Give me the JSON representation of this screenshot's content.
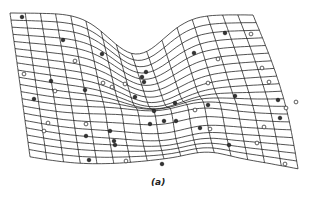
{
  "figure": {
    "caption": "(a)",
    "line_color": "#1a1a1a",
    "point_fill_dark": "#333333",
    "point_fill_light": "#ffffff",
    "grid": {
      "cols": 16,
      "rows": 20,
      "corners": {
        "top_left": [
          10,
          13
        ],
        "top_right": [
          253,
          15
        ],
        "bottom_right": [
          298,
          167
        ],
        "bottom_left": [
          30,
          155
        ]
      }
    },
    "points": [
      {
        "x": 22,
        "y": 17,
        "type": "dark"
      },
      {
        "x": 63,
        "y": 40,
        "type": "dark"
      },
      {
        "x": 102,
        "y": 54,
        "type": "dark"
      },
      {
        "x": 75,
        "y": 61,
        "type": "light"
      },
      {
        "x": 24,
        "y": 74,
        "type": "light"
      },
      {
        "x": 51,
        "y": 81,
        "type": "dark"
      },
      {
        "x": 55,
        "y": 91,
        "type": "light"
      },
      {
        "x": 85,
        "y": 90,
        "type": "dark"
      },
      {
        "x": 34,
        "y": 99,
        "type": "dark"
      },
      {
        "x": 103,
        "y": 83,
        "type": "light"
      },
      {
        "x": 112,
        "y": 87,
        "type": "light"
      },
      {
        "x": 125,
        "y": 84,
        "type": "light"
      },
      {
        "x": 146,
        "y": 72,
        "type": "dark"
      },
      {
        "x": 142,
        "y": 77,
        "type": "dark"
      },
      {
        "x": 144,
        "y": 82,
        "type": "dark"
      },
      {
        "x": 135,
        "y": 97,
        "type": "dark"
      },
      {
        "x": 48,
        "y": 123,
        "type": "light"
      },
      {
        "x": 44,
        "y": 131,
        "type": "light"
      },
      {
        "x": 86,
        "y": 124,
        "type": "light"
      },
      {
        "x": 86,
        "y": 136,
        "type": "dark"
      },
      {
        "x": 110,
        "y": 131,
        "type": "dark"
      },
      {
        "x": 114,
        "y": 141,
        "type": "dark"
      },
      {
        "x": 115,
        "y": 145,
        "type": "dark"
      },
      {
        "x": 89,
        "y": 160,
        "type": "dark"
      },
      {
        "x": 126,
        "y": 161,
        "type": "light"
      },
      {
        "x": 162,
        "y": 164,
        "type": "dark"
      },
      {
        "x": 154,
        "y": 111,
        "type": "dark"
      },
      {
        "x": 150,
        "y": 124,
        "type": "dark"
      },
      {
        "x": 175,
        "y": 103,
        "type": "dark"
      },
      {
        "x": 164,
        "y": 121,
        "type": "dark"
      },
      {
        "x": 208,
        "y": 105,
        "type": "dark"
      },
      {
        "x": 176,
        "y": 121,
        "type": "dark"
      },
      {
        "x": 195,
        "y": 110,
        "type": "light"
      },
      {
        "x": 210,
        "y": 129,
        "type": "light"
      },
      {
        "x": 200,
        "y": 128,
        "type": "dark"
      },
      {
        "x": 225,
        "y": 33,
        "type": "dark"
      },
      {
        "x": 251,
        "y": 34,
        "type": "light"
      },
      {
        "x": 194,
        "y": 53,
        "type": "dark"
      },
      {
        "x": 218,
        "y": 59,
        "type": "light"
      },
      {
        "x": 262,
        "y": 68,
        "type": "light"
      },
      {
        "x": 269,
        "y": 82,
        "type": "light"
      },
      {
        "x": 208,
        "y": 83,
        "type": "light"
      },
      {
        "x": 235,
        "y": 96,
        "type": "dark"
      },
      {
        "x": 278,
        "y": 100,
        "type": "dark"
      },
      {
        "x": 280,
        "y": 118,
        "type": "dark"
      },
      {
        "x": 264,
        "y": 127,
        "type": "light"
      },
      {
        "x": 257,
        "y": 143,
        "type": "light"
      },
      {
        "x": 229,
        "y": 145,
        "type": "dark"
      },
      {
        "x": 285,
        "y": 164,
        "type": "light"
      },
      {
        "x": 286,
        "y": 108,
        "type": "light"
      },
      {
        "x": 296,
        "y": 102,
        "type": "light"
      }
    ]
  }
}
